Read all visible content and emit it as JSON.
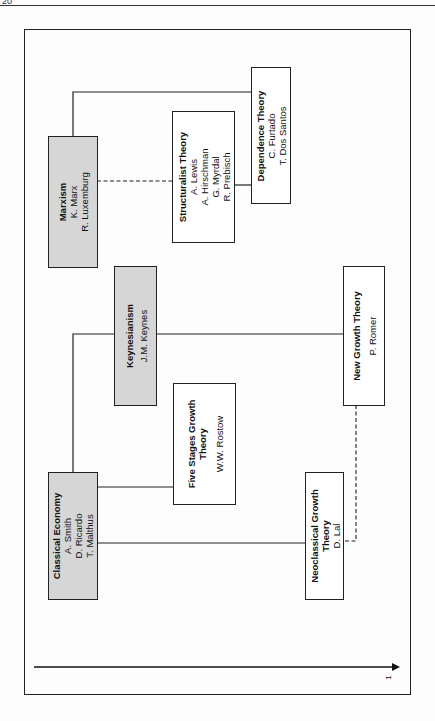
{
  "page": {
    "page_number": "20"
  },
  "diagram": {
    "orientation": "rotated-90-ccw",
    "axis": {
      "label": "1",
      "direction": "right"
    },
    "nodes": [
      {
        "id": "marxism",
        "title": "Marxism",
        "names": [
          "K. Marx",
          "R. Luxemburg"
        ],
        "shaded": true
      },
      {
        "id": "structuralist",
        "title": "Structuralist Theory",
        "names": [
          "A. Lewis",
          "A. Hirschman",
          "G. Myrdal",
          "R. Prebisch"
        ],
        "shaded": false
      },
      {
        "id": "dependence",
        "title": "Dependence Theory",
        "names": [
          "C. Furtado",
          "T. Dos Santos"
        ],
        "shaded": false
      },
      {
        "id": "keynesianism",
        "title": "Keynesianism",
        "names": [
          "J.M. Keynes"
        ],
        "shaded": true
      },
      {
        "id": "five-stages",
        "title_lines": [
          "Five Stages Growth",
          "Theory"
        ],
        "names": [
          "W.W. Rostow"
        ],
        "shaded": false
      },
      {
        "id": "new-growth",
        "title": "New Growth Theory",
        "names": [
          "P. Romer"
        ],
        "shaded": false
      },
      {
        "id": "classical",
        "title": "Classical Economy",
        "names": [
          "A. Smith",
          "D. Ricardo",
          "T. Malthus"
        ],
        "shaded": true
      },
      {
        "id": "neoclassical",
        "title_lines": [
          "Neoclassical Growth",
          "Theory"
        ],
        "names": [
          "D. Lal"
        ],
        "shaded": false
      }
    ],
    "edges": [
      {
        "from": "marxism",
        "to": "dependence",
        "style": "solid"
      },
      {
        "from": "marxism",
        "to": "structuralist",
        "style": "dashed"
      },
      {
        "from": "structuralist",
        "to": "dependence",
        "style": "solid"
      },
      {
        "from": "classical",
        "to": "keynesianism",
        "style": "solid"
      },
      {
        "from": "keynesianism",
        "to": "new-growth",
        "style": "solid"
      },
      {
        "from": "classical",
        "to": "five-stages",
        "style": "solid"
      },
      {
        "from": "classical",
        "to": "neoclassical",
        "style": "solid"
      },
      {
        "from": "new-growth",
        "to": "neoclassical",
        "style": "dashed"
      }
    ]
  }
}
